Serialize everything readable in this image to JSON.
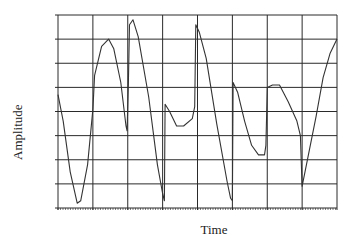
{
  "chart_data": {
    "type": "line",
    "title": "",
    "xlabel": "Time",
    "ylabel": "Amplitude",
    "grid": true,
    "legend": null,
    "x_tick_labels": [],
    "y_tick_labels": [],
    "grid_columns": 8,
    "grid_rows": 8,
    "xlim": [
      0,
      8
    ],
    "ylim": [
      0,
      8
    ],
    "series": [
      {
        "name": "waveform",
        "color": "#333333",
        "points": [
          [
            0.0,
            4.7
          ],
          [
            0.15,
            3.6
          ],
          [
            0.35,
            1.5
          ],
          [
            0.55,
            0.2
          ],
          [
            0.65,
            0.3
          ],
          [
            0.85,
            1.8
          ],
          [
            1.0,
            4.1
          ],
          [
            1.05,
            5.5
          ],
          [
            1.25,
            6.7
          ],
          [
            1.45,
            7.0
          ],
          [
            1.6,
            6.6
          ],
          [
            1.8,
            5.2
          ],
          [
            1.95,
            3.4
          ],
          [
            1.98,
            3.2
          ],
          [
            2.02,
            5.2
          ],
          [
            2.05,
            7.6
          ],
          [
            2.15,
            7.8
          ],
          [
            2.3,
            7.1
          ],
          [
            2.6,
            4.6
          ],
          [
            2.85,
            1.8
          ],
          [
            3.0,
            0.6
          ],
          [
            3.05,
            0.3
          ],
          [
            3.07,
            4.3
          ],
          [
            3.2,
            4.0
          ],
          [
            3.4,
            3.4
          ],
          [
            3.6,
            3.4
          ],
          [
            3.85,
            3.7
          ],
          [
            3.92,
            4.2
          ],
          [
            3.95,
            7.6
          ],
          [
            4.05,
            7.3
          ],
          [
            4.25,
            6.2
          ],
          [
            4.55,
            3.5
          ],
          [
            4.85,
            1.1
          ],
          [
            4.95,
            0.4
          ],
          [
            5.0,
            0.3
          ],
          [
            5.02,
            5.2
          ],
          [
            5.15,
            4.8
          ],
          [
            5.35,
            3.6
          ],
          [
            5.55,
            2.6
          ],
          [
            5.75,
            2.2
          ],
          [
            5.92,
            2.2
          ],
          [
            5.96,
            2.6
          ],
          [
            6.0,
            5.0
          ],
          [
            6.15,
            5.1
          ],
          [
            6.35,
            5.1
          ],
          [
            6.6,
            4.4
          ],
          [
            6.85,
            3.6
          ],
          [
            6.95,
            3.0
          ],
          [
            7.0,
            0.9
          ],
          [
            7.15,
            2.0
          ],
          [
            7.4,
            3.8
          ],
          [
            7.6,
            5.4
          ],
          [
            7.8,
            6.4
          ],
          [
            8.0,
            7.0
          ]
        ]
      }
    ]
  },
  "labels": {
    "xlabel": "Time",
    "ylabel": "Amplitude"
  },
  "style": {
    "line_color": "#333333",
    "grid_color": "#2a2a2a",
    "background": "#ffffff"
  }
}
